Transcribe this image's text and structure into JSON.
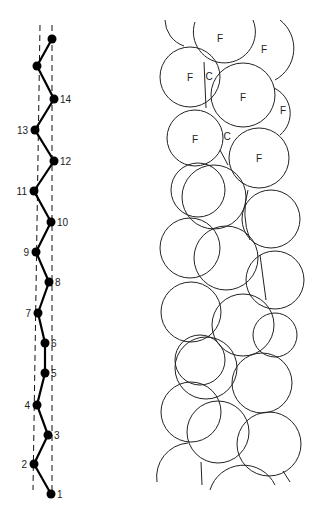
{
  "diagram": {
    "left_panel": {
      "description": "helical backbone projection with numbered nodes",
      "nodes": [
        {
          "label": "",
          "x": 52,
          "y": 39
        },
        {
          "label": "",
          "x": 37,
          "y": 66
        },
        {
          "label": "14",
          "x": 54,
          "y": 99
        },
        {
          "label": "13",
          "x": 35,
          "y": 130
        },
        {
          "label": "12",
          "x": 54,
          "y": 161
        },
        {
          "label": "11",
          "x": 34,
          "y": 191
        },
        {
          "label": "10",
          "x": 51,
          "y": 222
        },
        {
          "label": "9",
          "x": 36,
          "y": 252
        },
        {
          "label": "8",
          "x": 49,
          "y": 282
        },
        {
          "label": "7",
          "x": 38,
          "y": 313
        },
        {
          "label": "6",
          "x": 45,
          "y": 343
        },
        {
          "label": "5",
          "x": 45,
          "y": 373
        },
        {
          "label": "4",
          "x": 37,
          "y": 405
        },
        {
          "label": "3",
          "x": 48,
          "y": 435
        },
        {
          "label": "2",
          "x": 34,
          "y": 464
        },
        {
          "label": "1",
          "x": 51,
          "y": 494
        }
      ]
    },
    "right_panel": {
      "description": "space-filling sphere model",
      "labels": [
        {
          "text": "F",
          "x": 220,
          "y": 38
        },
        {
          "text": "F",
          "x": 264,
          "y": 49
        },
        {
          "text": "F",
          "x": 190,
          "y": 77
        },
        {
          "text": "C",
          "x": 209,
          "y": 76
        },
        {
          "text": "F",
          "x": 243,
          "y": 97
        },
        {
          "text": "F",
          "x": 283,
          "y": 110
        },
        {
          "text": "F",
          "x": 195,
          "y": 139
        },
        {
          "text": "C",
          "x": 227,
          "y": 136
        },
        {
          "text": "F",
          "x": 259,
          "y": 158
        }
      ]
    }
  }
}
